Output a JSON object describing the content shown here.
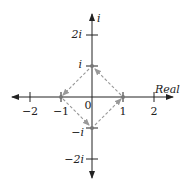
{
  "diagram": {
    "type": "complex-plane",
    "axes": {
      "real_label": "Real",
      "imag_label": "i",
      "x_ticks": [
        {
          "value": -2,
          "label": "−2"
        },
        {
          "value": -1,
          "label": "−1"
        },
        {
          "value": 1,
          "label": "1"
        },
        {
          "value": 2,
          "label": "2"
        }
      ],
      "y_ticks": [
        {
          "value": 2,
          "label": "2i"
        },
        {
          "value": 1,
          "label": "i"
        },
        {
          "value": -1,
          "label": "−i"
        },
        {
          "value": -2,
          "label": "−2i"
        }
      ],
      "origin_label": "0"
    },
    "points": [
      "1",
      "i",
      "-1",
      "-i"
    ],
    "arrows": [
      {
        "from": "1",
        "to": "i"
      },
      {
        "from": "i",
        "to": "-1"
      },
      {
        "from": "-1",
        "to": "-i"
      },
      {
        "from": "-i",
        "to": "1"
      }
    ],
    "arrow_style": "dashed",
    "colors": {
      "axis": "#222222",
      "arrow": "#999999",
      "point": "#777777"
    }
  }
}
